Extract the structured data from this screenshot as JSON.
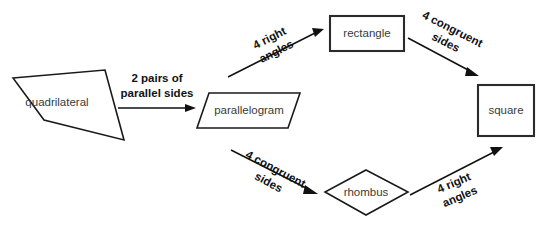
{
  "diagram": {
    "background_color": "#ffffff",
    "line_color": "#111111",
    "node_text_color": "#3a3a3a",
    "label_text_color": "#111111",
    "nodes": [
      {
        "id": "quadrilateral",
        "label": "quadrilateral",
        "shape": "irregular-quadrilateral",
        "text_x": 57,
        "text_y": 103
      },
      {
        "id": "parallelogram",
        "label": "parallelogram",
        "shape": "parallelogram",
        "text_x": 249,
        "text_y": 111
      },
      {
        "id": "rectangle",
        "label": "rectangle",
        "shape": "rectangle",
        "text_x": 367,
        "text_y": 33
      },
      {
        "id": "rhombus",
        "label": "rhombus",
        "shape": "rhombus",
        "text_x": 366,
        "text_y": 192
      },
      {
        "id": "square",
        "label": "square",
        "shape": "square",
        "text_x": 506,
        "text_y": 110
      }
    ],
    "edges": [
      {
        "id": "quad-to-parallelogram",
        "from": "quadrilateral",
        "to": "parallelogram",
        "line1": "2 pairs of",
        "line2": "parallel sides",
        "rotation": 0,
        "label_x": 157,
        "label_y": 86
      },
      {
        "id": "parallelogram-to-rectangle",
        "from": "parallelogram",
        "to": "rectangle",
        "line1": "4 right",
        "line2": "angles",
        "rotation": -27,
        "label_x": 273,
        "label_y": 45
      },
      {
        "id": "rectangle-to-square",
        "from": "rectangle",
        "to": "square",
        "line1": "4 congruent",
        "line2": "sides",
        "rotation": 27,
        "label_x": 449,
        "label_y": 38
      },
      {
        "id": "parallelogram-to-rhombus",
        "from": "parallelogram",
        "to": "rhombus",
        "line1": "4 congruent",
        "line2": "sides",
        "rotation": 28,
        "label_x": 272,
        "label_y": 178
      },
      {
        "id": "rhombus-to-square",
        "from": "rhombus",
        "to": "square",
        "line1": "4 right",
        "line2": "angles",
        "rotation": -23,
        "label_x": 455,
        "label_y": 192
      }
    ]
  }
}
